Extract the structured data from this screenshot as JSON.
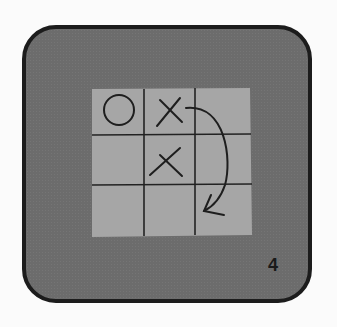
{
  "card": {
    "step_number": "4",
    "background_color": "#6c6c6c",
    "border_color": "#1c1c1c"
  },
  "board": {
    "cell_color": "#a6a6a6",
    "line_color": "#222222",
    "cells": [
      [
        "O",
        "X",
        ""
      ],
      [
        "",
        "X",
        ""
      ],
      [
        "",
        "",
        ""
      ]
    ],
    "annotation": "curved-arrow from top-right of X at row1/col2 down to bottom-right cell"
  }
}
